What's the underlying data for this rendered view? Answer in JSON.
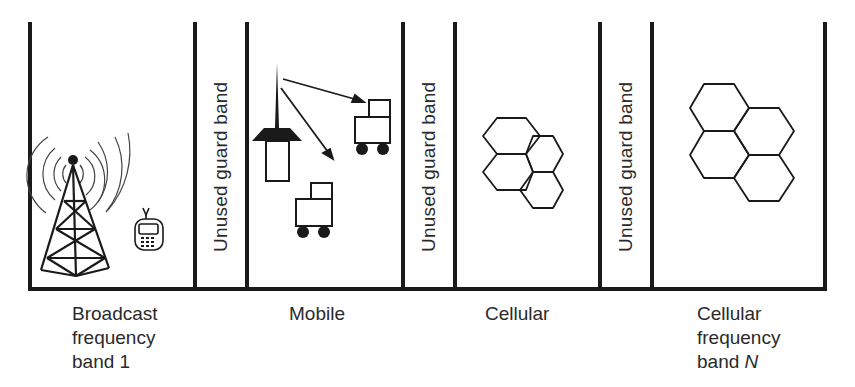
{
  "diagram": {
    "colors": {
      "line": "#1a1a1a",
      "text": "#2a2a2a",
      "background": "#ffffff"
    },
    "guard_bands": [
      {
        "label": "Unused guard band"
      },
      {
        "label": "Unused guard band"
      },
      {
        "label": "Unused guard band"
      }
    ],
    "bands": [
      {
        "name": "broadcast",
        "label_lines": [
          "Broadcast",
          "frequency",
          "band 1"
        ],
        "icons": [
          "broadcast-tower-icon",
          "cell-phone-icon"
        ]
      },
      {
        "name": "mobile",
        "label_lines": [
          "Mobile"
        ],
        "icons": [
          "base-station-icon",
          "vehicle-icon",
          "vehicle-icon"
        ]
      },
      {
        "name": "cellular",
        "label_lines": [
          "Cellular"
        ],
        "icons": [
          "hexagon-cells-icon"
        ]
      },
      {
        "name": "cellular-band-n",
        "label_lines": [
          "Cellular",
          "frequency",
          "band "
        ],
        "label_suffix_italic": "N",
        "icons": [
          "hexagon-cells-icon"
        ]
      }
    ]
  }
}
